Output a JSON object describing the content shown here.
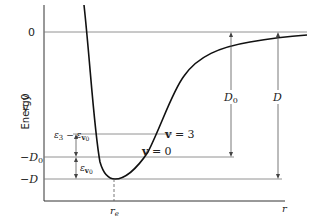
{
  "figure": {
    "y_axis_label": "Energy",
    "x_axis_label": "r",
    "levels": {
      "zero": "0",
      "negative": "< 0",
      "minus_D0": "−D",
      "minus_D0_sub": "0",
      "minus_D": "−D"
    },
    "vibrational_labels": {
      "v3": "v = 3",
      "v0": "v = 0",
      "v3_sym": "v",
      "v3_val": " = 3",
      "v0_sym": "v",
      "v0_val": " = 0"
    },
    "interval_labels": {
      "eps3_minus_eps0": "ε",
      "eps3_sub": "3",
      "minus": " − ε",
      "v0_sub": "v",
      "v0_subsub": "0",
      "eps_v0": "ε",
      "eps_v0_sub": "v",
      "eps_v0_subsub": "0"
    },
    "dissociation_labels": {
      "D0": "D",
      "D0_sub": "0",
      "D": "D"
    },
    "equilibrium_label": "r",
    "equilibrium_sub": "e",
    "colors": {
      "line": "#222222",
      "curve": "#111111",
      "level": "#666666"
    }
  }
}
